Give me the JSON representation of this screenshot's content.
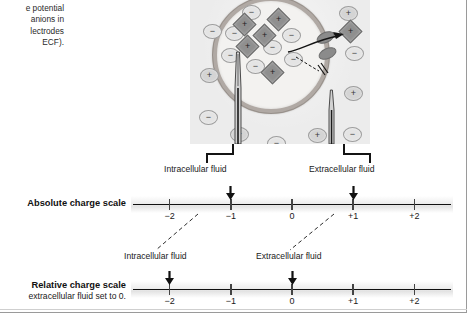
{
  "figure": {
    "caption_lines": [
      "e potential",
      "anions in",
      "lectrodes",
      "ECF)."
    ]
  },
  "cell_diagram": {
    "name": "cell-membrane-potential-diagram",
    "intracellular_label": "Intracellular fluid",
    "extracellular_label": "Extracellular fluid",
    "intracellular_ions": [
      {
        "kind": "circle",
        "sign": "−",
        "x": 52,
        "y": 43
      },
      {
        "kind": "circle",
        "sign": "−",
        "x": 35,
        "y": 64
      },
      {
        "kind": "circle",
        "sign": "−",
        "x": 31,
        "y": 86
      },
      {
        "kind": "circle",
        "sign": "−",
        "x": 56,
        "y": 97
      },
      {
        "kind": "circle",
        "sign": "−",
        "x": 73,
        "y": 78
      },
      {
        "kind": "circle",
        "sign": "−",
        "x": 92,
        "y": 66
      },
      {
        "kind": "circle",
        "sign": "−",
        "x": 94,
        "y": 90
      },
      {
        "kind": "diamond",
        "sign": "+",
        "x": 46,
        "y": 54
      },
      {
        "kind": "diamond",
        "sign": "+",
        "x": 80,
        "y": 49
      },
      {
        "kind": "diamond",
        "sign": "+",
        "x": 66,
        "y": 65
      },
      {
        "kind": "diamond",
        "sign": "+",
        "x": 49,
        "y": 76
      },
      {
        "kind": "diamond",
        "sign": "+",
        "x": 74,
        "y": 102
      }
    ],
    "extracellular_ions": [
      {
        "kind": "circle",
        "sign": "+",
        "x": 23,
        "y": 0
      },
      {
        "kind": "circle",
        "sign": "+",
        "x": 149,
        "y": 44
      },
      {
        "kind": "circle",
        "sign": "−",
        "x": 13,
        "y": 62
      },
      {
        "kind": "circle",
        "sign": "+",
        "x": 10,
        "y": 106
      },
      {
        "kind": "circle",
        "sign": "−",
        "x": 9,
        "y": 148
      },
      {
        "kind": "circle",
        "sign": "+",
        "x": 40,
        "y": 165
      },
      {
        "kind": "circle",
        "sign": "−",
        "x": 77,
        "y": 174
      },
      {
        "kind": "circle",
        "sign": "+",
        "x": 118,
        "y": 166
      },
      {
        "kind": "circle",
        "sign": "−",
        "x": 153,
        "y": 165
      },
      {
        "kind": "circle",
        "sign": "+",
        "x": 154,
        "y": 124
      },
      {
        "kind": "circle",
        "sign": "−",
        "x": 155,
        "y": 84
      },
      {
        "kind": "diamond",
        "sign": "+",
        "x": 152,
        "y": 61
      }
    ],
    "channels": [
      {
        "x": 128,
        "y": 72
      },
      {
        "x": 130,
        "y": 86
      }
    ],
    "efflux_arrow": "cation moves out through channel",
    "blocked_arrow": "anion blocked at membrane"
  },
  "absolute_scale": {
    "title": "Absolute charge scale",
    "ticks": [
      "−2",
      "−1",
      "0",
      "+1",
      "+2"
    ],
    "values": [
      -2,
      -1,
      0,
      1,
      2
    ],
    "markers": [
      {
        "label": "Intracellular fluid",
        "value": -1
      },
      {
        "label": "Extracellular fluid",
        "value": 1
      }
    ]
  },
  "relative_scale": {
    "title": "Relative charge scale",
    "subtitle": "extracellular fluid set to 0.",
    "ticks": [
      "−2",
      "−1",
      "0",
      "+1",
      "+2"
    ],
    "values": [
      -2,
      -1,
      0,
      1,
      2
    ],
    "markers": [
      {
        "label": "Intracellular fluid",
        "value": -2
      },
      {
        "label": "Extracellular fluid",
        "value": 0
      }
    ]
  },
  "colors": {
    "panel_bg": "#ececec",
    "membrane": "#b0a9a4",
    "cytosol": "#f3f2f0",
    "anion_fill": "#dcdcdc",
    "protein_fill": "#8f8f8f",
    "axis": "#111111",
    "text": "#1a1a1a"
  }
}
